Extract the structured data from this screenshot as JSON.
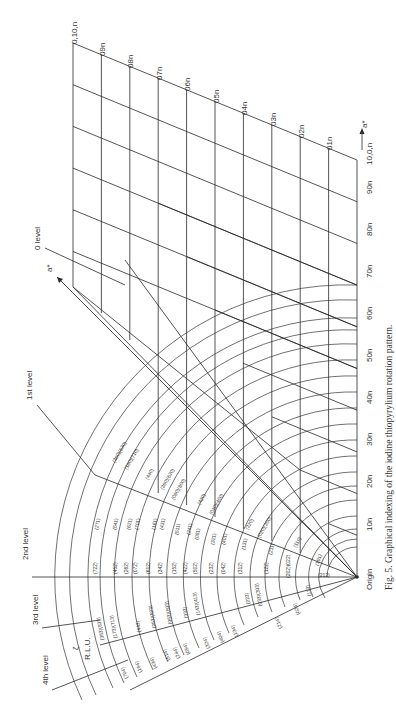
{
  "figure": {
    "caption": "Fig. 5.   Graphical indexing of the iodine thiopyrylium rotation pattern.",
    "origin_label": "Origin",
    "axis_a_star": "a*",
    "axis_b_star": "a*",
    "zeta_label": "ζ",
    "rlu_label": "R.L.U.",
    "levels": [
      "0 level",
      "1st level",
      "2nd level",
      "3rd level",
      "4th level"
    ],
    "row_labels": [
      "10n",
      "20n",
      "30n",
      "40n",
      "50n",
      "60n",
      "70n",
      "80n",
      "90n",
      "10,0,n"
    ],
    "col_labels": [
      "01n",
      "02n",
      "03n",
      "04n",
      "05n",
      "06n",
      "07n",
      "08n",
      "09n",
      "0,10,n"
    ],
    "reflections": {
      "level_0": [
        "(360)(630)",
        "(180)(710)",
        "(440)",
        "(260)(620)",
        "(080)(800)",
        "(420)",
        "(040)(400)",
        "(220)",
        "(020)(200)",
        "(110)"
      ],
      "level_1": [
        "(271)",
        "(541)",
        "(621)",
        "(701)",
        "(161)",
        "(431)",
        "(511)",
        "(241)",
        "(081)",
        "(321)",
        "(401)",
        "(131)",
        "(211)",
        "(101)"
      ],
      "level_2": [
        "(722)",
        "(452)",
        "(262)",
        "(072)",
        "(612)",
        "(342)",
        "(152)",
        "(422)",
        "(502)",
        "(232)",
        "(042)",
        "(312)",
        "(122)",
        "(202)(022)",
        "(212)"
      ],
      "level_3": [
        "(363)(633)",
        "(173)(713)",
        "(443)",
        "(253)(523)",
        "(063)(603)",
        "(333)",
        "(143)(413)",
        "(223)",
        "(033)(303)",
        "(113)"
      ],
      "level_4": [
        "(704)",
        "(164)",
        "(434)",
        "(514)",
        "(244)",
        "(054)",
        "(324)",
        "(404)",
        "(134)",
        "(214)",
        "(024)"
      ]
    }
  }
}
